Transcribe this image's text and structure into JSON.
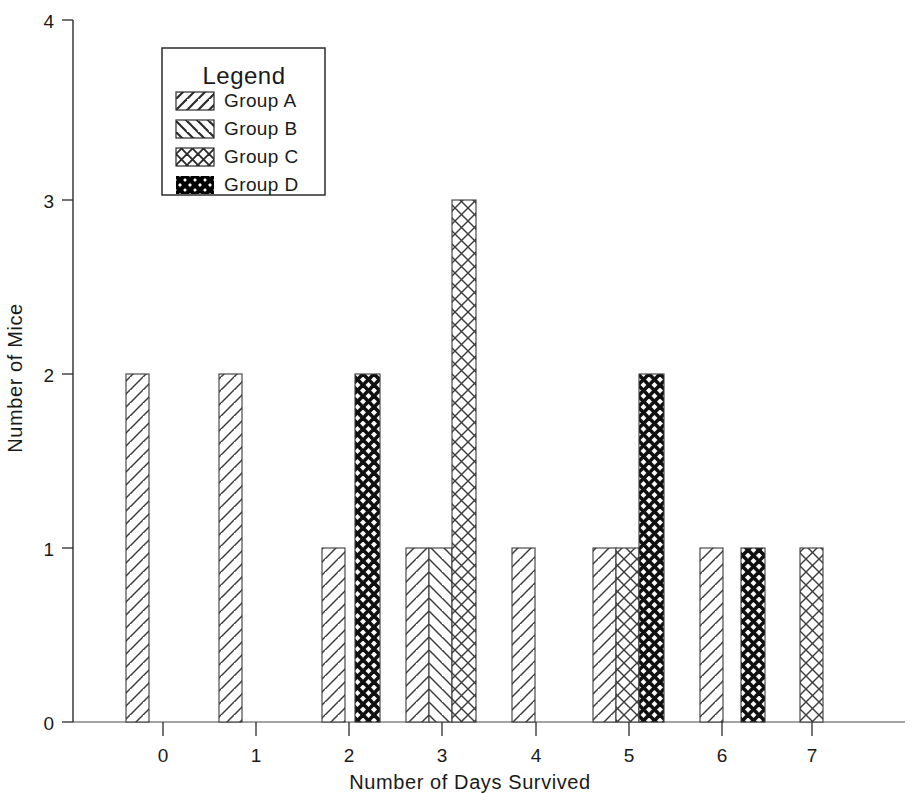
{
  "chart_data": {
    "type": "bar",
    "title": "",
    "xlabel": "Number of Days Survived",
    "ylabel": "Number of Mice",
    "xlim": [
      -0.65,
      7.65
    ],
    "ylim": [
      0,
      4
    ],
    "xticks": [
      "0",
      "1",
      "2",
      "3",
      "4",
      "5",
      "6",
      "7"
    ],
    "yticks": [
      "0",
      "1",
      "2",
      "3",
      "4"
    ],
    "grid": false,
    "legend_position": "upper-left-inset",
    "legend_title": "Legend",
    "categories": [
      "0",
      "1",
      "2",
      "3",
      "4",
      "5",
      "6",
      "7"
    ],
    "series": [
      {
        "name": "Group A",
        "pattern": "forward-hatch",
        "color": "#1a1a1a",
        "values": [
          2,
          2,
          1,
          1,
          1,
          1,
          1,
          0
        ]
      },
      {
        "name": "Group B",
        "pattern": "backward-hatch",
        "color": "#1a1a1a",
        "values": [
          0,
          0,
          0,
          1,
          0,
          0,
          0,
          0
        ]
      },
      {
        "name": "Group C",
        "pattern": "crosshatch-light",
        "color": "#1a1a1a",
        "values": [
          0,
          0,
          0,
          3,
          0,
          1,
          0,
          1
        ]
      },
      {
        "name": "Group D",
        "pattern": "crosshatch-bold",
        "color": "#111111",
        "values": [
          0,
          0,
          2,
          0,
          0,
          2,
          1,
          0
        ]
      }
    ],
    "bars": [
      {
        "group": "Group A",
        "x": 0,
        "value": 2,
        "pattern": "forward-hatch",
        "px_left": 126,
        "px_width": 23
      },
      {
        "group": "Group A",
        "x": 1,
        "value": 2,
        "pattern": "forward-hatch",
        "px_left": 219,
        "px_width": 23
      },
      {
        "group": "Group A",
        "x": 2,
        "value": 1,
        "pattern": "forward-hatch",
        "px_left": 322,
        "px_width": 23
      },
      {
        "group": "Group D",
        "x": 2,
        "value": 2,
        "pattern": "crosshatch-bold",
        "px_left": 355,
        "px_width": 25
      },
      {
        "group": "Group A",
        "x": 3,
        "value": 1,
        "pattern": "forward-hatch",
        "px_left": 406,
        "px_width": 23
      },
      {
        "group": "Group B",
        "x": 3,
        "value": 1,
        "pattern": "backward-hatch",
        "px_left": 429,
        "px_width": 23
      },
      {
        "group": "Group C",
        "x": 3,
        "value": 3,
        "pattern": "crosshatch-light",
        "px_left": 452,
        "px_width": 24
      },
      {
        "group": "Group A",
        "x": 4,
        "value": 1,
        "pattern": "forward-hatch",
        "px_left": 512,
        "px_width": 23
      },
      {
        "group": "Group A",
        "x": 5,
        "value": 1,
        "pattern": "forward-hatch",
        "px_left": 593,
        "px_width": 23
      },
      {
        "group": "Group C",
        "x": 5,
        "value": 1,
        "pattern": "crosshatch-light",
        "px_left": 616,
        "px_width": 23
      },
      {
        "group": "Group D",
        "x": 5,
        "value": 2,
        "pattern": "crosshatch-bold",
        "px_left": 639,
        "px_width": 25
      },
      {
        "group": "Group A",
        "x": 6,
        "value": 1,
        "pattern": "forward-hatch",
        "px_left": 700,
        "px_width": 23
      },
      {
        "group": "Group D",
        "x": 6,
        "value": 1,
        "pattern": "crosshatch-bold",
        "px_left": 741,
        "px_width": 24
      },
      {
        "group": "Group C",
        "x": 7,
        "value": 1,
        "pattern": "crosshatch-light",
        "px_left": 800,
        "px_width": 23
      }
    ]
  },
  "legend": {
    "title": "Legend",
    "items": [
      {
        "label": "Group A",
        "pattern": "forward-hatch"
      },
      {
        "label": "Group B",
        "pattern": "backward-hatch"
      },
      {
        "label": "Group C",
        "pattern": "crosshatch-light"
      },
      {
        "label": "Group D",
        "pattern": "crosshatch-bold"
      }
    ]
  },
  "axes": {
    "x_title": "Number of Days Survived",
    "y_title": "Number of Mice",
    "x_tick_labels": [
      "0",
      "1",
      "2",
      "3",
      "4",
      "5",
      "6",
      "7"
    ],
    "y_tick_labels": [
      "0",
      "1",
      "2",
      "3",
      "4"
    ]
  }
}
